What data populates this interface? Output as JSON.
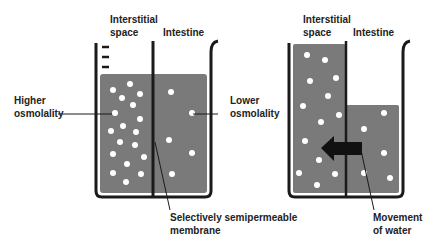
{
  "colors": {
    "fluid": "#7a7a7a",
    "outline": "#1a1a1a",
    "particle": "#ffffff",
    "arrow": "#111111",
    "text": "#222222"
  },
  "left_diagram": {
    "label_interstitial_line1": "Interstitial",
    "label_interstitial_line2": "space",
    "label_intestine": "Intestine",
    "label_higher_line1": "Higher",
    "label_higher_line2": "osmolality",
    "label_lower_line1": "Lower",
    "label_lower_line2": "osmolality",
    "label_membrane_line1": "Selectively semipermeable",
    "label_membrane_line2": "membrane",
    "particles_interstitial": [
      [
        113,
        90
      ],
      [
        130,
        84
      ],
      [
        140,
        94
      ],
      [
        122,
        98
      ],
      [
        133,
        105
      ],
      [
        115,
        113
      ],
      [
        140,
        119
      ],
      [
        111,
        131
      ],
      [
        123,
        126
      ],
      [
        136,
        132
      ],
      [
        120,
        142
      ],
      [
        135,
        145
      ],
      [
        113,
        154
      ],
      [
        144,
        157
      ],
      [
        127,
        164
      ],
      [
        113,
        173
      ],
      [
        141,
        174
      ],
      [
        126,
        182
      ]
    ],
    "particles_intestine": [
      [
        171,
        92
      ],
      [
        192,
        113
      ],
      [
        169,
        140
      ],
      [
        192,
        153
      ],
      [
        172,
        174
      ]
    ]
  },
  "right_diagram": {
    "label_interstitial_line1": "Interstitial",
    "label_interstitial_line2": "space",
    "label_intestine": "Intestine",
    "label_movement_line1": "Movement",
    "label_movement_line2": "of water",
    "particles_interstitial": [
      [
        307,
        55
      ],
      [
        325,
        60
      ],
      [
        310,
        81
      ],
      [
        336,
        78
      ],
      [
        328,
        96
      ],
      [
        303,
        106
      ],
      [
        339,
        115
      ],
      [
        321,
        122
      ],
      [
        305,
        141
      ],
      [
        319,
        160
      ],
      [
        299,
        173
      ],
      [
        335,
        174
      ],
      [
        317,
        185
      ]
    ],
    "particles_intestine": [
      [
        384,
        113
      ],
      [
        364,
        129
      ],
      [
        384,
        153
      ],
      [
        364,
        173
      ],
      [
        390,
        178
      ]
    ]
  }
}
